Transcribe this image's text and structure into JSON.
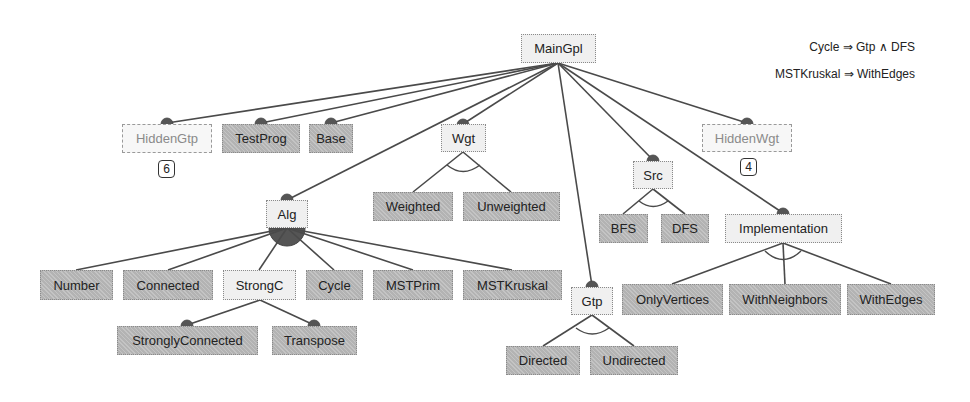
{
  "diagram": {
    "type": "feature-model",
    "root": "MainGpl",
    "nodes": {
      "maingpl": {
        "label": "MainGpl",
        "kind": "abstract"
      },
      "hiddengtp": {
        "label": "HiddenGtp",
        "kind": "hidden",
        "badge": "6"
      },
      "testprog": {
        "label": "TestProg",
        "kind": "concrete",
        "mandatory": true
      },
      "base": {
        "label": "Base",
        "kind": "concrete",
        "mandatory": true
      },
      "alg": {
        "label": "Alg",
        "kind": "abstract",
        "mandatory": true,
        "group": "or"
      },
      "wgt": {
        "label": "Wgt",
        "kind": "abstract",
        "mandatory": true,
        "group": "alternative"
      },
      "gtp": {
        "label": "Gtp",
        "kind": "abstract",
        "mandatory": true,
        "group": "alternative"
      },
      "src": {
        "label": "Src",
        "kind": "abstract",
        "mandatory": true,
        "group": "alternative"
      },
      "hiddenwgt": {
        "label": "HiddenWgt",
        "kind": "hidden",
        "badge": "4",
        "mandatory": true
      },
      "implementation": {
        "label": "Implementation",
        "kind": "abstract",
        "mandatory": true,
        "group": "alternative"
      },
      "number": {
        "label": "Number",
        "kind": "concrete"
      },
      "connected": {
        "label": "Connected",
        "kind": "concrete"
      },
      "strongc": {
        "label": "StrongC",
        "kind": "abstract"
      },
      "cycle": {
        "label": "Cycle",
        "kind": "concrete"
      },
      "mstprim": {
        "label": "MSTPrim",
        "kind": "concrete"
      },
      "mstkruskal": {
        "label": "MSTKruskal",
        "kind": "concrete"
      },
      "stronglyconnected": {
        "label": "StronglyConnected",
        "kind": "concrete",
        "mandatory": true
      },
      "transpose": {
        "label": "Transpose",
        "kind": "concrete",
        "mandatory": true
      },
      "weighted": {
        "label": "Weighted",
        "kind": "concrete"
      },
      "unweighted": {
        "label": "Unweighted",
        "kind": "concrete"
      },
      "directed": {
        "label": "Directed",
        "kind": "concrete"
      },
      "undirected": {
        "label": "Undirected",
        "kind": "concrete"
      },
      "bfs": {
        "label": "BFS",
        "kind": "concrete"
      },
      "dfs": {
        "label": "DFS",
        "kind": "concrete"
      },
      "onlyvertices": {
        "label": "OnlyVertices",
        "kind": "concrete"
      },
      "withneighbors": {
        "label": "WithNeighbors",
        "kind": "concrete"
      },
      "withedges": {
        "label": "WithEdges",
        "kind": "concrete"
      }
    },
    "edges": [
      [
        "maingpl",
        "hiddengtp"
      ],
      [
        "maingpl",
        "testprog"
      ],
      [
        "maingpl",
        "base"
      ],
      [
        "maingpl",
        "alg"
      ],
      [
        "maingpl",
        "wgt"
      ],
      [
        "maingpl",
        "gtp"
      ],
      [
        "maingpl",
        "src"
      ],
      [
        "maingpl",
        "implementation"
      ],
      [
        "maingpl",
        "hiddenwgt"
      ],
      [
        "alg",
        "number"
      ],
      [
        "alg",
        "connected"
      ],
      [
        "alg",
        "strongc"
      ],
      [
        "alg",
        "cycle"
      ],
      [
        "alg",
        "mstprim"
      ],
      [
        "alg",
        "mstkruskal"
      ],
      [
        "strongc",
        "stronglyconnected"
      ],
      [
        "strongc",
        "transpose"
      ],
      [
        "wgt",
        "weighted"
      ],
      [
        "wgt",
        "unweighted"
      ],
      [
        "gtp",
        "directed"
      ],
      [
        "gtp",
        "undirected"
      ],
      [
        "src",
        "bfs"
      ],
      [
        "src",
        "dfs"
      ],
      [
        "implementation",
        "onlyvertices"
      ],
      [
        "implementation",
        "withneighbors"
      ],
      [
        "implementation",
        "withedges"
      ]
    ],
    "constraints": [
      "Cycle ⇒ Gtp ∧ DFS",
      "MSTKruskal ⇒ WithEdges"
    ]
  }
}
